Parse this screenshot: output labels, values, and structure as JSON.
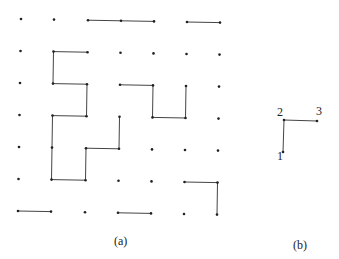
{
  "panels": [
    {
      "id": "a",
      "caption": "(a)",
      "grid": {
        "cols": [
          21,
          54,
          88,
          121,
          154,
          187,
          220
        ],
        "rows": [
          19,
          51,
          83,
          115,
          147,
          179,
          211
        ],
        "dx_per_row": -0.5
      },
      "segments": [
        [
          [
            2,
            0
          ],
          [
            3,
            0
          ]
        ],
        [
          [
            3,
            0
          ],
          [
            4,
            0
          ]
        ],
        [
          [
            5,
            0
          ],
          [
            6,
            0
          ]
        ],
        [
          [
            1,
            1
          ],
          [
            2,
            1
          ]
        ],
        [
          [
            1,
            1
          ],
          [
            1,
            2
          ]
        ],
        [
          [
            1,
            2
          ],
          [
            2,
            2
          ]
        ],
        [
          [
            2,
            2
          ],
          [
            2,
            3
          ]
        ],
        [
          [
            1,
            3
          ],
          [
            2,
            3
          ]
        ],
        [
          [
            1,
            3
          ],
          [
            1,
            4
          ]
        ],
        [
          [
            1,
            4
          ],
          [
            1,
            5
          ]
        ],
        [
          [
            1,
            5
          ],
          [
            2,
            5
          ]
        ],
        [
          [
            2,
            5
          ],
          [
            2,
            4
          ]
        ],
        [
          [
            2,
            4
          ],
          [
            3,
            4
          ]
        ],
        [
          [
            3,
            4
          ],
          [
            3,
            3
          ]
        ],
        [
          [
            3,
            2
          ],
          [
            4,
            2
          ]
        ],
        [
          [
            4,
            2
          ],
          [
            4,
            3
          ]
        ],
        [
          [
            4,
            3
          ],
          [
            5,
            3
          ]
        ],
        [
          [
            5,
            3
          ],
          [
            5,
            2
          ]
        ],
        [
          [
            5,
            5
          ],
          [
            6,
            5
          ]
        ],
        [
          [
            6,
            5
          ],
          [
            6,
            6
          ]
        ],
        [
          [
            0,
            6
          ],
          [
            1,
            6
          ]
        ],
        [
          [
            3,
            6
          ],
          [
            4,
            6
          ]
        ]
      ]
    },
    {
      "id": "b",
      "caption": "(b)",
      "points": [
        {
          "label": "1",
          "x": 283,
          "y": 152
        },
        {
          "label": "2",
          "x": 284,
          "y": 120
        },
        {
          "label": "3",
          "x": 317,
          "y": 121
        }
      ]
    }
  ],
  "captions": {
    "a": "(a)",
    "b": "(b)"
  },
  "labels_b": {
    "p1": "1",
    "p2": "2",
    "p3": "3"
  }
}
